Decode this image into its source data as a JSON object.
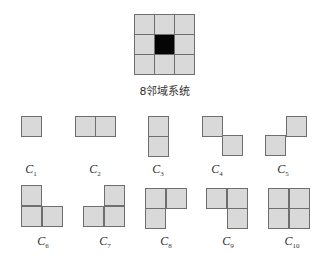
{
  "figure": {
    "neighborhood": {
      "caption": "8邻域系统",
      "grid": 3,
      "center_color": "#050505",
      "cell_color": "#d9d9d9"
    },
    "cliques": [
      {
        "id": "C1",
        "base": "C",
        "sub": "1",
        "cells": [
          [
            0,
            0
          ]
        ]
      },
      {
        "id": "C2",
        "base": "C",
        "sub": "2",
        "cells": [
          [
            0,
            0
          ],
          [
            1,
            0
          ]
        ]
      },
      {
        "id": "C3",
        "base": "C",
        "sub": "3",
        "cells": [
          [
            0,
            0
          ],
          [
            0,
            1
          ]
        ]
      },
      {
        "id": "C4",
        "base": "C",
        "sub": "4",
        "cells": [
          [
            0,
            0
          ],
          [
            1,
            1
          ]
        ]
      },
      {
        "id": "C5",
        "base": "C",
        "sub": "5",
        "cells": [
          [
            1,
            0
          ],
          [
            0,
            1
          ]
        ]
      },
      {
        "id": "C6",
        "base": "C",
        "sub": "6",
        "cells": [
          [
            0,
            0
          ],
          [
            0,
            1
          ],
          [
            1,
            1
          ]
        ]
      },
      {
        "id": "C7",
        "base": "C",
        "sub": "7",
        "cells": [
          [
            1,
            0
          ],
          [
            0,
            1
          ],
          [
            1,
            1
          ]
        ]
      },
      {
        "id": "C8",
        "base": "C",
        "sub": "8",
        "cells": [
          [
            0,
            0
          ],
          [
            1,
            0
          ],
          [
            0,
            1
          ]
        ]
      },
      {
        "id": "C9",
        "base": "C",
        "sub": "9",
        "cells": [
          [
            0,
            0
          ],
          [
            1,
            0
          ],
          [
            1,
            1
          ]
        ]
      },
      {
        "id": "C10",
        "base": "C",
        "sub": "10",
        "cells": [
          [
            0,
            0
          ],
          [
            1,
            0
          ],
          [
            0,
            1
          ],
          [
            1,
            1
          ]
        ]
      }
    ]
  }
}
